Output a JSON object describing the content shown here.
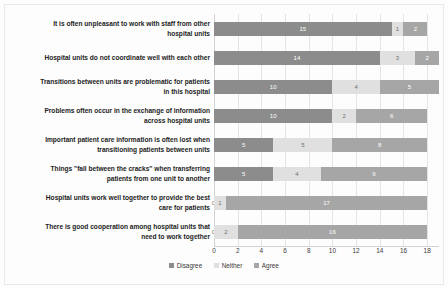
{
  "chart_data": {
    "type": "bar",
    "orientation": "horizontal",
    "stacked": true,
    "title": "",
    "xlabel": "",
    "ylabel": "",
    "xlim": [
      0,
      19
    ],
    "xticks": [
      0,
      2,
      4,
      6,
      8,
      10,
      12,
      14,
      16,
      18
    ],
    "grid": true,
    "legend_position": "bottom",
    "categories": [
      "It is often unpleasant to work with staff from other hospital units",
      "Hospital units do not coordinate well with each other",
      "Transitions between units are problematic for patients in this hospital",
      "Problems often occur in the exchange of information across hospital units",
      "Important patient care information is often lost when transitioning patients between units",
      "Things \"fall between the cracks\" when transferring patients from one unit to another",
      "Hospital units work well together to provide the best care for patients",
      "There is good cooperation among hospital units that need to work together"
    ],
    "category_lines": [
      [
        "It is often unpleasant to work with staff from other",
        "hospital units"
      ],
      [
        "Hospital units do not coordinate well with each other"
      ],
      [
        "Transitions between units are problematic for patients",
        "in this hospital"
      ],
      [
        "Problems often occur in the exchange of information",
        "across hospital units"
      ],
      [
        "Important patient care information is often lost when",
        "transitioning patients between units"
      ],
      [
        "Things \"fall between the cracks\" when transferring",
        "patients from one unit to another"
      ],
      [
        "Hospital units work well together to provide the best",
        "care for patients"
      ],
      [
        "There is good cooperation among hospital units that",
        "need to work together"
      ]
    ],
    "series": [
      {
        "name": "Disagree",
        "color": "#8c8c8c",
        "values": [
          15,
          14,
          10,
          10,
          5,
          5,
          0,
          0
        ]
      },
      {
        "name": "Neither",
        "color": "#e0e0e0",
        "values": [
          1,
          3,
          4,
          2,
          5,
          4,
          1,
          2
        ]
      },
      {
        "name": "Agree",
        "color": "#a6a6a6",
        "values": [
          2,
          2,
          5,
          6,
          8,
          9,
          17,
          16
        ]
      }
    ]
  },
  "legend": {
    "items": [
      {
        "label": "Disagree",
        "color": "#8c8c8c"
      },
      {
        "label": "Neither",
        "color": "#e0e0e0"
      },
      {
        "label": "Agree",
        "color": "#a6a6a6"
      }
    ]
  }
}
